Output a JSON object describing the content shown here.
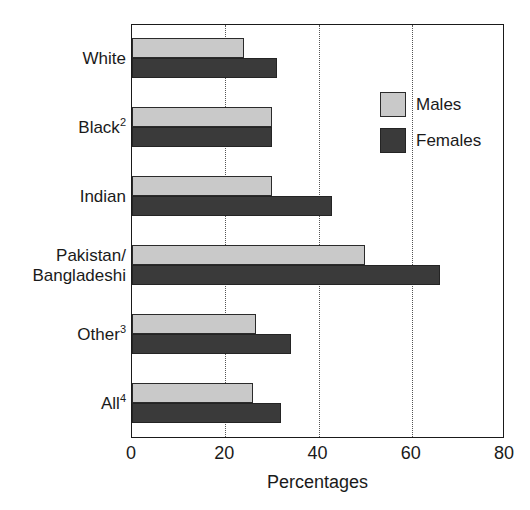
{
  "chart_data": {
    "type": "bar",
    "orientation": "horizontal",
    "title": "",
    "subtitle": "",
    "xlabel": "Percentages",
    "ylabel": "",
    "xlim": [
      0,
      80
    ],
    "xticks": [
      0,
      20,
      40,
      60,
      80
    ],
    "xtick_labels": [
      "0",
      "20",
      "40",
      "60",
      "80"
    ],
    "grid": "vertical-dotted",
    "legend_position": "inside-top-right",
    "categories": [
      "White",
      "Black2",
      "Indian",
      "Pakistan/\nBangladeshi",
      "Other3",
      "All4"
    ],
    "category_labels": [
      {
        "text": "White",
        "sup": ""
      },
      {
        "text": "Black",
        "sup": "2"
      },
      {
        "text": "Indian",
        "sup": ""
      },
      {
        "text": "Pakistan/\nBangladeshi",
        "sup": ""
      },
      {
        "text": "Other",
        "sup": "3"
      },
      {
        "text": "All",
        "sup": "4"
      }
    ],
    "series": [
      {
        "name": "Males",
        "color": "#c9c9c9",
        "values": [
          24,
          30,
          30,
          50,
          26.5,
          26
        ]
      },
      {
        "name": "Females",
        "color": "#3a3a3a",
        "values": [
          31,
          30,
          43,
          66,
          34,
          32
        ]
      }
    ]
  },
  "axis": {
    "x_title": "Percentages",
    "tick_labels": [
      "0",
      "20",
      "40",
      "60",
      "80"
    ]
  },
  "legend": {
    "items": [
      {
        "label": "Males",
        "color": "#c9c9c9"
      },
      {
        "label": "Females",
        "color": "#3a3a3a"
      }
    ]
  },
  "colors": {
    "males": "#c9c9c9",
    "females": "#3a3a3a",
    "axis": "#1a1a1a",
    "grid": "#555555",
    "background": "#ffffff"
  }
}
